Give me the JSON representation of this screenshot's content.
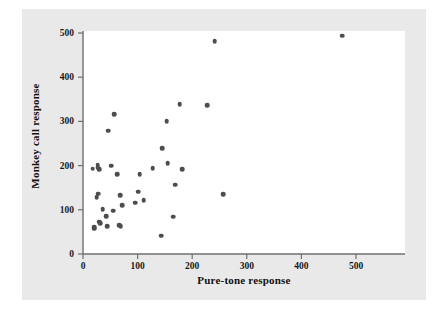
{
  "chart_data": {
    "type": "scatter",
    "title": "",
    "xlabel": "Pure-tone response",
    "ylabel": "Monkey call response",
    "xlim": [
      0,
      550
    ],
    "ylim": [
      0,
      520
    ],
    "xticks": [
      0,
      100,
      200,
      300,
      400,
      500
    ],
    "yticks": [
      0,
      100,
      200,
      300,
      400,
      500
    ],
    "grid": false,
    "legend": null,
    "marker_color": "#4d4d4d",
    "plot_bg": "#ffffff",
    "panel_bg": "#e9e9e9",
    "points": [
      {
        "x": 18,
        "y": 193
      },
      {
        "x": 20,
        "y": 60
      },
      {
        "x": 21,
        "y": 57
      },
      {
        "x": 25,
        "y": 128
      },
      {
        "x": 27,
        "y": 202
      },
      {
        "x": 27,
        "y": 196
      },
      {
        "x": 28,
        "y": 136
      },
      {
        "x": 30,
        "y": 192
      },
      {
        "x": 30,
        "y": 73
      },
      {
        "x": 31,
        "y": 70
      },
      {
        "x": 36,
        "y": 102
      },
      {
        "x": 42,
        "y": 86
      },
      {
        "x": 44,
        "y": 63
      },
      {
        "x": 46,
        "y": 279
      },
      {
        "x": 52,
        "y": 200
      },
      {
        "x": 55,
        "y": 98
      },
      {
        "x": 57,
        "y": 316
      },
      {
        "x": 63,
        "y": 180
      },
      {
        "x": 66,
        "y": 65
      },
      {
        "x": 68,
        "y": 133
      },
      {
        "x": 69,
        "y": 63
      },
      {
        "x": 72,
        "y": 111
      },
      {
        "x": 96,
        "y": 116
      },
      {
        "x": 101,
        "y": 141
      },
      {
        "x": 104,
        "y": 180
      },
      {
        "x": 111,
        "y": 122
      },
      {
        "x": 128,
        "y": 194
      },
      {
        "x": 143,
        "y": 41
      },
      {
        "x": 145,
        "y": 239
      },
      {
        "x": 153,
        "y": 301
      },
      {
        "x": 155,
        "y": 205
      },
      {
        "x": 165,
        "y": 84
      },
      {
        "x": 169,
        "y": 157
      },
      {
        "x": 177,
        "y": 339
      },
      {
        "x": 182,
        "y": 192
      },
      {
        "x": 228,
        "y": 336
      },
      {
        "x": 241,
        "y": 481
      },
      {
        "x": 257,
        "y": 135
      },
      {
        "x": 475,
        "y": 494
      }
    ]
  }
}
